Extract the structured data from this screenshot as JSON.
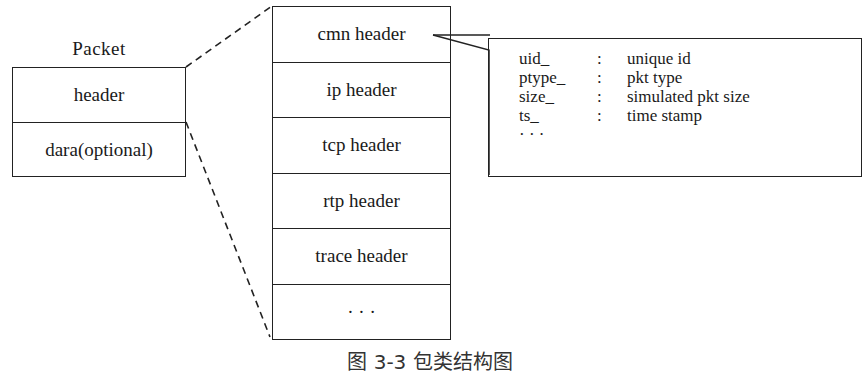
{
  "diagram": {
    "packet": {
      "title": "Packet",
      "rows": [
        {
          "label": "header"
        },
        {
          "label": "dara(optional)"
        }
      ]
    },
    "header_stack": {
      "rows": [
        {
          "label": "cmn header"
        },
        {
          "label": "ip header"
        },
        {
          "label": "tcp header"
        },
        {
          "label": "rtp header"
        },
        {
          "label": "trace header"
        },
        {
          "label": "· · ·"
        }
      ]
    },
    "cmn_header_fields": {
      "rows": [
        {
          "name": "uid_",
          "sep": ":",
          "desc": "unique id"
        },
        {
          "name": "ptype_",
          "sep": ":",
          "desc": "pkt type"
        },
        {
          "name": "size_",
          "sep": ":",
          "desc": "simulated pkt size"
        },
        {
          "name": "ts_",
          "sep": ":",
          "desc": "time stamp"
        },
        {
          "name": "· · ·",
          "sep": "",
          "desc": ""
        }
      ]
    },
    "caption": "图 3-3   包类结构图",
    "colors": {
      "line": "#222222",
      "background": "#ffffff"
    }
  }
}
